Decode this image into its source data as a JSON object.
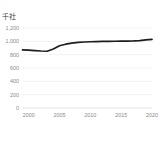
{
  "chart_data": {
    "type": "line",
    "title": "",
    "subtitle": "",
    "units_label": "千社",
    "xlabel": "",
    "ylabel": "",
    "x": [
      1999,
      2000,
      2001,
      2002,
      2003,
      2004,
      2005,
      2006,
      2007,
      2008,
      2009,
      2010,
      2011,
      2012,
      2013,
      2014,
      2015,
      2016,
      2017,
      2018,
      2019,
      2020
    ],
    "series": [
      {
        "name": "件数",
        "values": [
          872,
          868,
          862,
          855,
          851,
          886,
          933,
          957,
          974,
          985,
          990,
          994,
          997,
          999,
          1000,
          1001,
          1003,
          1004,
          1007,
          1012,
          1022,
          1030
        ]
      }
    ],
    "xlim": [
      1999,
      2020
    ],
    "ylim": [
      0,
      1200
    ],
    "xticks": [
      2000,
      2005,
      2010,
      2015,
      2020
    ],
    "xtick_labels": [
      "2000",
      "2005",
      "2010",
      "2015",
      "2020"
    ],
    "yticks": [
      0,
      200,
      400,
      600,
      800,
      1000,
      1200
    ],
    "ytick_labels": [
      "0",
      "200",
      "400",
      "600",
      "800",
      "1,000",
      "1,200"
    ],
    "grid": true,
    "grid_axis": "y",
    "legend": false,
    "legend_position": "none",
    "line_color": "#1d1d1d",
    "grid_color": "#ededed",
    "tick_label_color": "#8a8a8a",
    "background_color": "#ffffff"
  }
}
